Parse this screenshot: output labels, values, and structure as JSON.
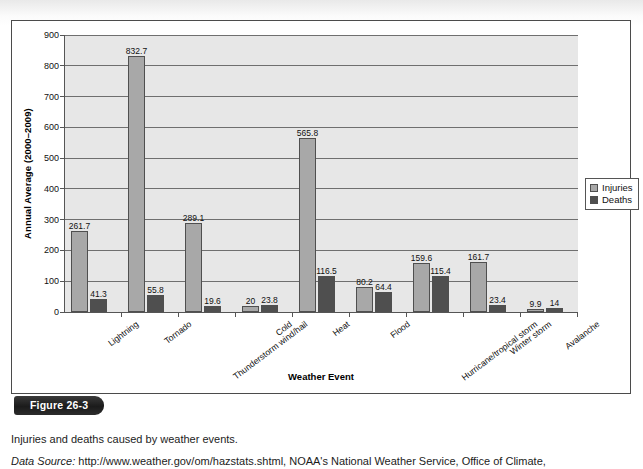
{
  "figure": {
    "badge_label": "Figure 26-3",
    "caption": "Injuries and deaths caused by weather events.",
    "source_label": "Data Source:",
    "source_text": " http://www.weather.gov/om/hazstats.shtml, NOAA's National Weather Service, Office of Climate,"
  },
  "legend": {
    "position": "right",
    "entries": [
      {
        "label": "Injuries",
        "color": "#a8a8a8"
      },
      {
        "label": "Deaths",
        "color": "#4f4f4f"
      }
    ]
  },
  "chart_data": {
    "type": "bar",
    "title": "",
    "xlabel": "Weather Event",
    "ylabel": "Annual Average (2000–2009)",
    "ylim": [
      0,
      900
    ],
    "yticks": [
      0,
      100,
      200,
      300,
      400,
      500,
      600,
      700,
      800,
      900
    ],
    "ytick_labels": [
      "0",
      "100",
      "200",
      "300",
      "400",
      "500",
      "600",
      "700",
      "800",
      "900"
    ],
    "grid": true,
    "grid_axis": "y",
    "legend_position": "right",
    "categories": [
      "Lightning",
      "Tornado",
      "Thunderstorm wind/hail",
      "Cold",
      "Heat",
      "Flood",
      "Hurricane/tropical storm",
      "Winter storm",
      "Avalanche"
    ],
    "series": [
      {
        "name": "Injuries",
        "color": "#a8a8a8",
        "values": [
          261.7,
          832.7,
          289.1,
          20,
          565.8,
          80.2,
          159.6,
          161.7,
          9.9
        ],
        "labels": [
          "261.7",
          "832.7",
          "289.1",
          "20",
          "565.8",
          "80.2",
          "159.6",
          "161.7",
          "9.9"
        ]
      },
      {
        "name": "Deaths",
        "color": "#4f4f4f",
        "values": [
          41.3,
          55.8,
          19.6,
          23.8,
          116.5,
          64.4,
          115.4,
          23.4,
          14
        ],
        "labels": [
          "41.3",
          "55.8",
          "19.6",
          "23.8",
          "116.5",
          "64.4",
          "115.4",
          "23.4",
          "14"
        ]
      }
    ]
  }
}
